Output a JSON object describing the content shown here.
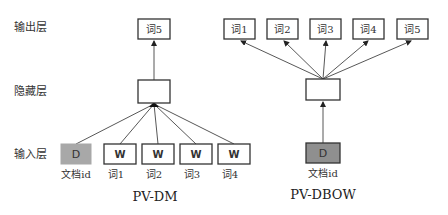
{
  "layer_labels": {
    "output": "输出层",
    "hidden": "隐藏层",
    "input": "输入层"
  },
  "pv_dm": {
    "title": "PV-DM",
    "output_box": "词5",
    "inputs": [
      {
        "box": "D",
        "label": "文档id",
        "fill": "#a8a8a8"
      },
      {
        "box": "W",
        "label": "词1"
      },
      {
        "box": "W",
        "label": "词2"
      },
      {
        "box": "W",
        "label": "词3"
      },
      {
        "box": "W",
        "label": "词4"
      }
    ]
  },
  "pv_dbow": {
    "title": "PV-DBOW",
    "outputs": [
      "词1",
      "词2",
      "词3",
      "词4",
      "词5"
    ],
    "input": {
      "box": "D",
      "label": "文档id",
      "fill": "#8f8f8f"
    }
  }
}
